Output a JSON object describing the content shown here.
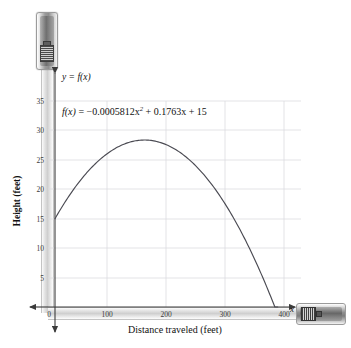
{
  "figure": {
    "curve_label": "y = f(x)",
    "equation": {
      "lhs": "f(x)",
      "eq": "=",
      "coef_a": "−0.0005812x",
      "exp_a": "2",
      "plus1": "+",
      "coef_b": "0.1763x",
      "plus2": "+",
      "coef_c": "15",
      "full": "f(x) = −0.0005812x² + 0.1763x + 15"
    },
    "x_axis_title": "Distance traveled (feet)",
    "y_axis_title": "Height (feet)",
    "x_axis_variable": "x",
    "origin_label": "0"
  },
  "icons": {
    "tape_measure_vertical": "tape-measure-icon",
    "tape_measure_horizontal": "tape-measure-icon"
  },
  "colors": {
    "curve": "#4a4a52",
    "axis": "#3b3b3b",
    "grid": "#d8d8dc",
    "tape": "#cfcfcf",
    "background": "#ffffff"
  },
  "chart_data": {
    "type": "line",
    "title": "",
    "subtitle": "",
    "xlabel": "Distance traveled (feet)",
    "ylabel": "Height (feet)",
    "xlim": [
      0,
      430
    ],
    "ylim": [
      0,
      38
    ],
    "xticks": [
      0,
      100,
      200,
      300,
      400
    ],
    "xtick_labels": [
      "0",
      "100",
      "200",
      "300",
      "400"
    ],
    "yticks": [
      0,
      5,
      10,
      15,
      20,
      25,
      30,
      35
    ],
    "ytick_labels": [
      "0",
      "5",
      "10",
      "15",
      "20",
      "25",
      "30",
      "35"
    ],
    "grid": true,
    "legend": null,
    "annotations": [
      {
        "text": "y = f(x)",
        "x": 10,
        "y": 37.5
      },
      {
        "text": "f(x) = −0.0005812x² + 0.1763x + 15",
        "x": 18,
        "y": 32.5
      }
    ],
    "function": {
      "expression": "-0.0005812*x^2 + 0.1763*x + 15",
      "a": -0.0005812,
      "b": 0.1763,
      "c": 15,
      "vertex_x": 151.7,
      "vertex_y": 28.37,
      "y_intercept": 15,
      "x_intercept": 377.4,
      "domain": [
        0,
        377.4
      ]
    },
    "series": [
      {
        "name": "f(x)",
        "x": [
          0,
          20,
          40,
          60,
          80,
          100,
          120,
          140,
          152,
          160,
          180,
          200,
          220,
          240,
          260,
          280,
          300,
          320,
          340,
          360,
          377.4
        ],
        "values": [
          15.0,
          18.3,
          21.1,
          23.5,
          25.4,
          26.8,
          27.8,
          28.3,
          28.4,
          28.3,
          27.8,
          27.0,
          25.6,
          23.8,
          21.5,
          18.8,
          15.6,
          12.0,
          7.8,
          3.2,
          0.0
        ]
      }
    ]
  }
}
